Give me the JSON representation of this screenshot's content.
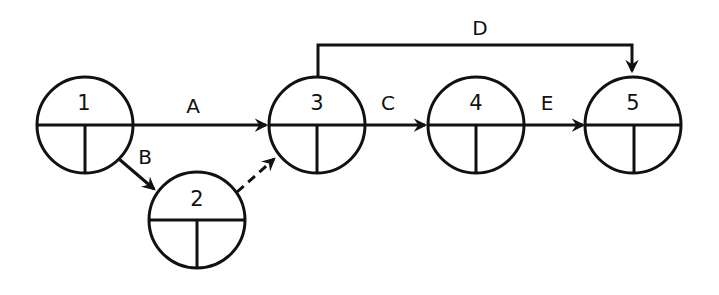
{
  "diagram": {
    "type": "activity-on-arrow network",
    "nodes": [
      {
        "id": "1",
        "label": "1",
        "cx": 85,
        "cy": 125
      },
      {
        "id": "2",
        "label": "2",
        "cx": 197,
        "cy": 220
      },
      {
        "id": "3",
        "label": "3",
        "cx": 317,
        "cy": 125
      },
      {
        "id": "4",
        "label": "4",
        "cx": 476,
        "cy": 125
      },
      {
        "id": "5",
        "label": "5",
        "cx": 633,
        "cy": 125
      }
    ],
    "edges": [
      {
        "id": "A",
        "label": "A",
        "from": "1",
        "to": "3",
        "style": "solid"
      },
      {
        "id": "B",
        "label": "B",
        "from": "1",
        "to": "2",
        "style": "solid"
      },
      {
        "id": "dummy",
        "label": "",
        "from": "2",
        "to": "3",
        "style": "dashed"
      },
      {
        "id": "C",
        "label": "C",
        "from": "3",
        "to": "4",
        "style": "solid"
      },
      {
        "id": "D",
        "label": "D",
        "from": "3",
        "to": "5",
        "style": "solid"
      },
      {
        "id": "E",
        "label": "E",
        "from": "4",
        "to": "5",
        "style": "solid"
      }
    ],
    "colors": {
      "stroke": "#111111",
      "background": "#ffffff"
    }
  }
}
